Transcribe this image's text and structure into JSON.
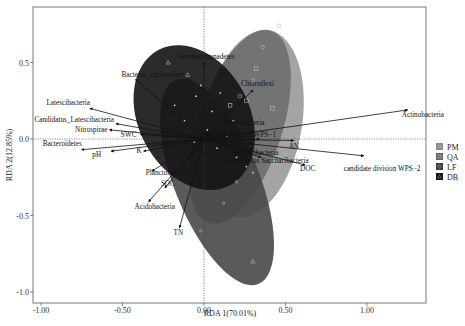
{
  "chart_data": {
    "type": "scatter",
    "subtype": "RDA biplot",
    "title": "",
    "xlabel": "RDA 1(70.01%)",
    "ylabel": "RDA 2(12.85%)",
    "xlim": [
      -1.05,
      1.37
    ],
    "ylim": [
      -1.07,
      0.86
    ],
    "x_ticks": [
      "-1.00",
      "-0.50",
      "0.00",
      "0.50",
      "1.00"
    ],
    "x_tick_values": [
      -1.0,
      -0.5,
      0.0,
      0.5,
      1.0
    ],
    "y_ticks": [
      "0.5",
      "0.0",
      "-0.5",
      "-1.0"
    ],
    "y_tick_values": [
      0.5,
      0.0,
      -0.5,
      -1.0
    ],
    "grid": false,
    "reference_lines": {
      "x": 0,
      "y": 0,
      "style": "dotted"
    },
    "legend": {
      "position": "right",
      "entries": [
        {
          "label": "PM",
          "color": "#8c8c8c",
          "marker": "circle"
        },
        {
          "label": "QA",
          "color": "#666666",
          "marker": "square"
        },
        {
          "label": "LF",
          "color": "#3d3d3d",
          "marker": "diamond"
        },
        {
          "label": "DB",
          "color": "#151515",
          "marker": "triangle"
        }
      ]
    },
    "group_ellipses": [
      {
        "group": "PM",
        "color": "#9a9a9a",
        "cx": 0.3,
        "cy": 0.1,
        "rx": 0.3,
        "ry": 0.62,
        "angle": 10
      },
      {
        "group": "QA",
        "color": "#6e6e6e",
        "cx": 0.22,
        "cy": 0.08,
        "rx": 0.26,
        "ry": 0.66,
        "angle": 18
      },
      {
        "group": "LF",
        "color": "#484848",
        "cx": 0.08,
        "cy": -0.28,
        "rx": 0.26,
        "ry": 0.72,
        "angle": -22
      },
      {
        "group": "DB",
        "color": "#141414",
        "cx": -0.06,
        "cy": 0.14,
        "rx": 0.34,
        "ry": 0.5,
        "angle": -28
      }
    ],
    "vectors": [
      {
        "label": "Actinobacteria",
        "x": 1.25,
        "y": 0.19
      },
      {
        "label": "candidate division WPS−2",
        "x": 0.98,
        "y": -0.11
      },
      {
        "label": "AN",
        "x": 0.55,
        "y": -0.01
      },
      {
        "label": "DOC",
        "x": 0.62,
        "y": -0.17
      },
      {
        "label": "Saccharibacteria",
        "x": 0.3,
        "y": -0.07
      },
      {
        "label": "Candidatus Saccharibacteria",
        "x": 0.35,
        "y": -0.12
      },
      {
        "label": "candidate division WPS−1",
        "x": 0.34,
        "y": 0.0
      },
      {
        "label": "Proteobacteria",
        "x": 0.3,
        "y": 0.05
      },
      {
        "label": "Chloroflexi",
        "x": 0.3,
        "y": 0.32
      },
      {
        "label": "Gemmatimonadetes",
        "x": 0.0,
        "y": 0.5
      },
      {
        "label": "Bacteria_unclassified",
        "x": -0.42,
        "y": 0.39
      },
      {
        "label": "Latescibacteria",
        "x": -0.7,
        "y": 0.2
      },
      {
        "label": "Candidatus_Latescibacteria",
        "x": -0.54,
        "y": 0.1
      },
      {
        "label": "Nitrospirae",
        "x": -0.58,
        "y": 0.06
      },
      {
        "label": "SWC",
        "x": -0.39,
        "y": 0.03
      },
      {
        "label": "Bacteroidetes",
        "x": -0.75,
        "y": -0.07
      },
      {
        "label": "pH",
        "x": -0.57,
        "y": -0.08
      },
      {
        "label": "K",
        "x": -0.37,
        "y": -0.08
      },
      {
        "label": "Planctomycetes",
        "x": -0.32,
        "y": -0.21
      },
      {
        "label": "SOC",
        "x": -0.24,
        "y": -0.32
      },
      {
        "label": "Acidobacteria",
        "x": -0.34,
        "y": -0.41
      },
      {
        "label": "TN",
        "x": -0.15,
        "y": -0.58
      }
    ],
    "points": [
      {
        "group": "PM",
        "x": 0.46,
        "y": 0.74
      },
      {
        "group": "PM",
        "x": 0.36,
        "y": 0.6
      },
      {
        "group": "PM",
        "x": 0.3,
        "y": 0.38
      },
      {
        "group": "PM",
        "x": 0.22,
        "y": 0.28
      },
      {
        "group": "QA",
        "x": 0.32,
        "y": 0.46
      },
      {
        "group": "QA",
        "x": 0.26,
        "y": 0.25
      },
      {
        "group": "QA",
        "x": 0.16,
        "y": 0.22
      },
      {
        "group": "QA",
        "x": 0.42,
        "y": 0.2
      },
      {
        "group": "LF",
        "x": 0.2,
        "y": -0.28
      },
      {
        "group": "LF",
        "x": 0.12,
        "y": -0.42
      },
      {
        "group": "LF",
        "x": -0.02,
        "y": -0.6
      },
      {
        "group": "DB",
        "x": 0.3,
        "y": -0.8
      },
      {
        "group": "DB",
        "x": -0.22,
        "y": 0.5
      },
      {
        "group": "DB",
        "x": -0.1,
        "y": 0.42
      }
    ]
  },
  "axes": {
    "x_label": "RDA 1(70.01%)",
    "y_label": "RDA 2(12.85%)"
  }
}
